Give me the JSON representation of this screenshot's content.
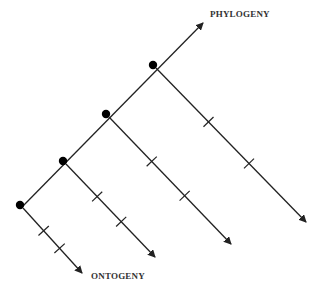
{
  "diagram": {
    "type": "phylogeny-ontogeny-diagram",
    "labels": {
      "phylogeny": "PHYLOGENY",
      "ontogeny": "ONTOGENY"
    },
    "colors": {
      "line": "#222222",
      "dot": "#000000",
      "text": "#333333"
    },
    "main_axis": {
      "from": [
        22,
        207
      ],
      "to": [
        203,
        23
      ],
      "arrow": true
    },
    "nodes": [
      {
        "dot": [
          20,
          205
        ],
        "branch_from": [
          23,
          208
        ],
        "branch_to": [
          82,
          273
        ],
        "ticks": 2
      },
      {
        "dot": [
          63,
          161
        ],
        "branch_from": [
          66,
          164
        ],
        "branch_to": [
          155,
          257
        ],
        "ticks": 2
      },
      {
        "dot": [
          106,
          114
        ],
        "branch_from": [
          109,
          117
        ],
        "branch_to": [
          231,
          244
        ],
        "ticks": 2
      },
      {
        "dot": [
          153,
          65
        ],
        "branch_from": [
          156,
          68
        ],
        "branch_to": [
          306,
          222
        ],
        "ticks": 2
      }
    ]
  }
}
